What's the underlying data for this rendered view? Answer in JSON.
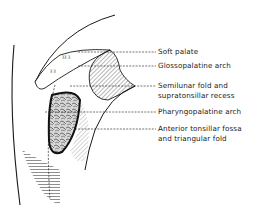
{
  "figure": {
    "type": "anatomical-line-drawing",
    "labels": [
      {
        "id": "soft-palate",
        "lines": [
          "Soft palate"
        ]
      },
      {
        "id": "glossopalatine-arch",
        "lines": [
          "Glossopalatine arch"
        ]
      },
      {
        "id": "semilunar-fold",
        "lines": [
          "Semilunar fold and",
          "supratonsillar recess"
        ]
      },
      {
        "id": "pharyngopalatine-arch",
        "lines": [
          "Pharyngopalatine arch"
        ]
      },
      {
        "id": "anterior-tonsillar-fossa",
        "lines": [
          "Anterior tonsillar fossa",
          "and triangular fold"
        ]
      }
    ],
    "colors": {
      "ink": "#1a1a1a",
      "background": "#ffffff"
    }
  }
}
